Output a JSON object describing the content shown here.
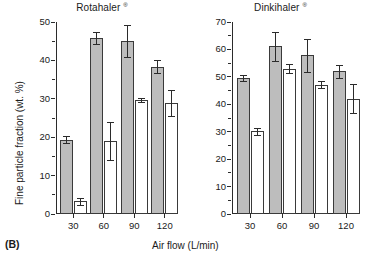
{
  "figure": {
    "panel_label": "(B)",
    "xlabel": "Air flow (L/min)",
    "ylabel": "Fine particle fraction (wt. %)",
    "registered_mark": "®",
    "colors": {
      "filled_bar": "#bdbdbd",
      "open_bar": "#ffffff",
      "line": "#2b2b2b"
    }
  },
  "chart_data": [
    {
      "type": "bar",
      "title": "Rotahaler",
      "title_suffix": "®",
      "xlabel": "Air flow (L/min)",
      "ylabel": "Fine particle fraction (wt. %)",
      "categories": [
        "30",
        "60",
        "90",
        "120"
      ],
      "ylim": [
        0,
        50
      ],
      "yticks": [
        0,
        10,
        20,
        30,
        40,
        50
      ],
      "ytick_labels": [
        "0",
        "10",
        "20",
        "30",
        "40",
        "50"
      ],
      "yminor_step": 5,
      "grid": false,
      "legend": null,
      "series": [
        {
          "name": "filled",
          "style": "filled",
          "values": [
            19.3,
            45.8,
            45.1,
            38.4
          ],
          "errors": [
            0.9,
            1.6,
            4.2,
            1.8
          ]
        },
        {
          "name": "open",
          "style": "open",
          "values": [
            3.3,
            19.0,
            29.7,
            28.8
          ],
          "errors": [
            0.9,
            5.0,
            0.5,
            3.4
          ]
        }
      ]
    },
    {
      "type": "bar",
      "title": "Dinkihaler",
      "title_suffix": "®",
      "xlabel": "Air flow (L/min)",
      "ylabel": "Fine particle fraction (wt. %)",
      "categories": [
        "30",
        "60",
        "90",
        "120"
      ],
      "ylim": [
        0,
        70
      ],
      "yticks": [
        0,
        10,
        20,
        30,
        40,
        50,
        60,
        70
      ],
      "ytick_labels": [
        "0",
        "10",
        "20",
        "30",
        "40",
        "50",
        "60",
        "70"
      ],
      "yminor_step": 5,
      "grid": false,
      "legend": null,
      "series": [
        {
          "name": "filled",
          "style": "filled",
          "values": [
            49.7,
            61.2,
            57.8,
            52.1
          ],
          "errors": [
            1.1,
            5.3,
            6.0,
            2.4
          ]
        },
        {
          "name": "open",
          "style": "open",
          "values": [
            30.1,
            53.0,
            47.2,
            42.0
          ],
          "errors": [
            1.2,
            1.6,
            1.2,
            5.3
          ]
        }
      ]
    }
  ]
}
